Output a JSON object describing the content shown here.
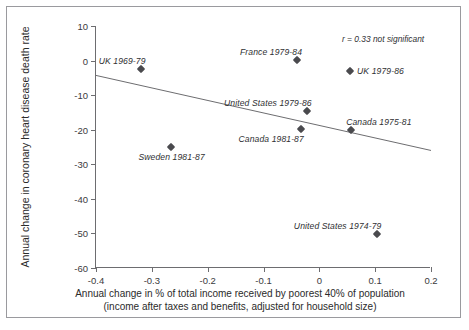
{
  "figure": {
    "cropped_caption_fragment": "",
    "correlation_note": "r = 0.33 not significant"
  },
  "chart_data": {
    "type": "scatter",
    "title": "",
    "xlabel_line1": "Annual change in % of total income received by poorest 40% of population",
    "xlabel_line2": "(income after taxes and benefits, adjusted for household size)",
    "ylabel": "Annual change in coronary heart disease death rate",
    "xlim": [
      -0.4,
      0.2
    ],
    "ylim": [
      -60,
      10
    ],
    "xticks": [
      -0.4,
      -0.3,
      -0.2,
      -0.1,
      0,
      0.1,
      0.2
    ],
    "xtick_labels": [
      "-0.4",
      "-0.3",
      "-0.2",
      "-0.1",
      "0",
      "0.1",
      "0.2"
    ],
    "yticks": [
      10,
      0,
      -10,
      -20,
      -30,
      -40,
      -50,
      -60
    ],
    "ytick_labels": [
      "10",
      "0",
      "-10",
      "-20",
      "-30",
      "-40",
      "-50",
      "-60"
    ],
    "grid": false,
    "legend": "none",
    "annotations": [
      "r = 0.33 not significant"
    ],
    "marker_color": "#4a4a4e",
    "axis_color": "#6d6d70",
    "trendline": {
      "x": [
        -0.4,
        0.2
      ],
      "y": [
        -4.3,
        -26.0
      ],
      "color": "#6d6d70"
    },
    "points": [
      {
        "label": "UK 1969-79",
        "x": -0.32,
        "y": -2.5,
        "label_pos": "above-left"
      },
      {
        "label": "Sweden 1981-87",
        "x": -0.265,
        "y": -25.0,
        "label_pos": "below"
      },
      {
        "label": "France 1979-84",
        "x": -0.04,
        "y": 0.3,
        "label_pos": "above-left"
      },
      {
        "label": "United States 1979-86",
        "x": -0.022,
        "y": -14.7,
        "label_pos": "above-left"
      },
      {
        "label": "Canada 1981-87",
        "x": -0.032,
        "y": -19.7,
        "label_pos": "below-left"
      },
      {
        "label": "UK 1979-86",
        "x": 0.055,
        "y": -3.0,
        "label_pos": "right"
      },
      {
        "label": "Canada 1975-81",
        "x": 0.057,
        "y": -20.0,
        "label_pos": "above-right"
      },
      {
        "label": "United States 1974-79",
        "x": 0.103,
        "y": -50.3,
        "label_pos": "above-left"
      }
    ]
  }
}
